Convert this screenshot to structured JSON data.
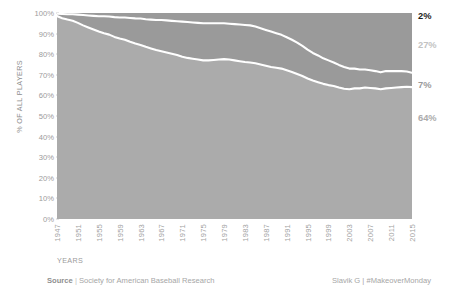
{
  "axes": {
    "y_title": "% OF ALL PLAYERS",
    "x_title": "YEARS",
    "y_ticks": [
      "100%",
      "90%",
      "80%",
      "70%",
      "60%",
      "50%",
      "40%",
      "30%",
      "20%",
      "10%",
      "0%"
    ],
    "x_ticks": [
      "1947",
      "1951",
      "1955",
      "1959",
      "1963",
      "1967",
      "1971",
      "1975",
      "1979",
      "1983",
      "1987",
      "1991",
      "1995",
      "1999",
      "2003",
      "2007",
      "2011",
      "2015"
    ]
  },
  "series_labels": [
    {
      "text": "2%",
      "color": "#1c1c1c"
    },
    {
      "text": "27%",
      "color": "#c2c2c2"
    },
    {
      "text": "7%",
      "color": "#9a9a9a"
    },
    {
      "text": "64%",
      "color": "#ababab"
    }
  ],
  "footer": {
    "source_label": "Source",
    "source_sep": "|",
    "source_text": "Society for American Baseball Research",
    "credit": "Slavik G | #MakeoverMonday"
  },
  "chart_data": {
    "type": "area",
    "title": "",
    "xlabel": "YEARS",
    "ylabel": "% OF ALL PLAYERS",
    "stacked": true,
    "normalized": true,
    "grid": false,
    "legend": "right-end-labels",
    "ylim": [
      0,
      100
    ],
    "xlim": [
      1947,
      2015
    ],
    "colors": {
      "white_band": "#b2b2b2",
      "black_band": "#1c1c1c",
      "hispanic_band": "#c2c2c2",
      "asian_band": "#9a9a9a",
      "separator": "#ffffff",
      "background": "#ffffff"
    },
    "end_values": {
      "white": 64,
      "black": 7,
      "hispanic": 27,
      "asian": 2
    },
    "x": [
      1947,
      1948,
      1949,
      1950,
      1951,
      1952,
      1953,
      1954,
      1955,
      1956,
      1957,
      1958,
      1959,
      1960,
      1961,
      1962,
      1963,
      1964,
      1965,
      1966,
      1967,
      1968,
      1969,
      1970,
      1971,
      1972,
      1973,
      1974,
      1975,
      1976,
      1977,
      1978,
      1979,
      1980,
      1981,
      1982,
      1983,
      1984,
      1985,
      1986,
      1987,
      1988,
      1989,
      1990,
      1991,
      1992,
      1993,
      1994,
      1995,
      1996,
      1997,
      1998,
      1999,
      2000,
      2001,
      2002,
      2003,
      2004,
      2005,
      2006,
      2007,
      2008,
      2009,
      2010,
      2011,
      2012,
      2013,
      2014,
      2015
    ],
    "series": [
      {
        "name": "White",
        "color": "#ababab",
        "values": [
          98.5,
          97.5,
          96.8,
          96.2,
          95.2,
          94.0,
          93.0,
          92.0,
          91.0,
          90.2,
          89.5,
          88.4,
          87.6,
          87.0,
          86.0,
          85.2,
          84.5,
          83.6,
          82.8,
          82.0,
          81.4,
          80.8,
          80.2,
          79.6,
          78.8,
          78.2,
          77.8,
          77.4,
          77.0,
          77.0,
          77.2,
          77.4,
          77.6,
          77.4,
          77.0,
          76.6,
          76.2,
          76.0,
          75.6,
          75.0,
          74.4,
          73.8,
          73.4,
          73.0,
          72.2,
          71.4,
          70.4,
          69.4,
          68.2,
          67.2,
          66.4,
          65.6,
          65.0,
          64.6,
          63.8,
          63.2,
          63.0,
          63.4,
          63.4,
          63.8,
          63.6,
          63.4,
          63.0,
          63.4,
          63.6,
          63.8,
          64.0,
          64.2,
          64.0
        ]
      },
      {
        "name": "Black",
        "color": "#9a9a9a",
        "values": [
          1.2,
          2.0,
          2.6,
          3.2,
          4.0,
          5.0,
          5.8,
          6.6,
          7.4,
          8.2,
          8.8,
          9.6,
          10.2,
          10.8,
          11.6,
          12.2,
          12.8,
          13.4,
          14.0,
          14.6,
          15.2,
          15.6,
          16.0,
          16.4,
          17.0,
          17.4,
          17.6,
          17.8,
          18.0,
          18.0,
          17.8,
          17.6,
          17.4,
          17.4,
          17.6,
          17.8,
          18.0,
          18.0,
          17.8,
          17.6,
          17.4,
          17.2,
          16.8,
          16.4,
          16.0,
          15.6,
          15.2,
          14.6,
          14.0,
          13.4,
          13.0,
          12.4,
          12.0,
          11.4,
          11.0,
          10.6,
          10.0,
          9.6,
          9.2,
          8.8,
          8.6,
          8.4,
          8.2,
          8.4,
          8.2,
          8.0,
          7.8,
          7.4,
          7.0
        ]
      },
      {
        "name": "Hispanic",
        "color": "#c2c2c2",
        "values": [
          0.3,
          0.5,
          0.6,
          0.6,
          0.8,
          1.0,
          1.2,
          1.4,
          1.6,
          1.6,
          1.7,
          2.0,
          2.2,
          2.2,
          2.4,
          2.6,
          2.7,
          3.0,
          3.2,
          3.4,
          3.4,
          3.6,
          3.8,
          4.0,
          4.2,
          4.4,
          4.6,
          4.8,
          5.0,
          5.0,
          5.0,
          5.0,
          5.0,
          5.2,
          5.4,
          5.6,
          5.8,
          6.0,
          6.6,
          7.4,
          8.2,
          9.0,
          9.8,
          10.6,
          11.8,
          13.0,
          14.4,
          16.0,
          17.8,
          19.4,
          20.6,
          22.0,
          23.0,
          24.0,
          25.2,
          26.2,
          26.8,
          26.7,
          27.0,
          26.9,
          27.0,
          27.2,
          27.7,
          27.0,
          26.9,
          26.8,
          26.7,
          26.8,
          27.0
        ]
      },
      {
        "name": "Asian",
        "color": "#1c1c1c",
        "values": [
          0,
          0,
          0,
          0,
          0,
          0,
          0,
          0,
          0,
          0,
          0,
          0,
          0,
          0,
          0,
          0,
          0,
          0,
          0,
          0,
          0,
          0,
          0,
          0,
          0,
          0,
          0,
          0,
          0,
          0,
          0,
          0,
          0,
          0,
          0,
          0,
          0,
          0,
          0,
          0,
          0,
          0,
          0,
          0,
          0,
          0,
          0,
          0,
          0,
          0,
          0,
          0,
          0,
          0,
          0,
          0,
          0.2,
          0.3,
          0.4,
          0.5,
          0.8,
          1.0,
          1.1,
          1.2,
          1.3,
          1.4,
          1.5,
          1.6,
          2.0
        ]
      }
    ]
  }
}
